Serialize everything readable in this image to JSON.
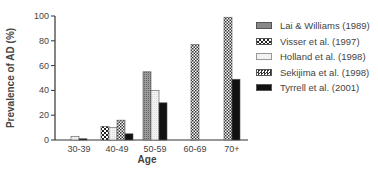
{
  "chart_data": {
    "type": "bar",
    "title": "",
    "xlabel": "Age",
    "ylabel": "Prevalence of AD (%)",
    "ylim": [
      0,
      100
    ],
    "yticks": [
      0,
      20,
      40,
      60,
      80,
      100
    ],
    "categories": [
      "30-39",
      "40-49",
      "50-59",
      "60-69",
      "70+"
    ],
    "series": [
      {
        "name": "Lai & Williams (1989)",
        "pattern": "dense-dots",
        "values": [
          null,
          null,
          55,
          null,
          null
        ]
      },
      {
        "name": "Visser et al. (1997)",
        "pattern": "checker",
        "values": [
          null,
          11,
          null,
          null,
          null
        ]
      },
      {
        "name": "Holland et al. (1998)",
        "pattern": "light",
        "values": [
          3,
          10,
          40,
          null,
          null
        ]
      },
      {
        "name": "Sekijima et al. (1998)",
        "pattern": "diamond-checker",
        "values": [
          null,
          16,
          null,
          77,
          99
        ]
      },
      {
        "name": "Tyrrell et al. (2001)",
        "pattern": "solid-black",
        "values": [
          1,
          5,
          30,
          null,
          49
        ]
      }
    ],
    "grid": false,
    "legend_position": "right"
  },
  "legend": [
    "Lai & Williams (1989)",
    "Visser et al. (1997)",
    "Holland et al. (1998)",
    "Sekijima et al. (1998)",
    "Tyrrell et al. (2001)"
  ]
}
